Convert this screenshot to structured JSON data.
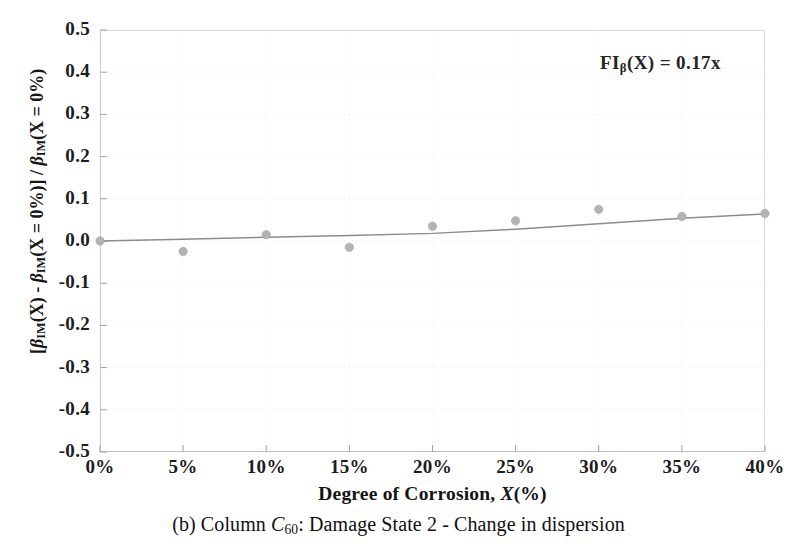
{
  "figure": {
    "caption_prefix": "(b) Column ",
    "caption_symbol": "C",
    "caption_symbol_sub": "60",
    "caption_suffix": ": Damage State 2 - Change in dispersion",
    "caption_full": "(b) Column C60: Damage State 2 - Change in dispersion"
  },
  "annotation": {
    "text_prefix": "FI",
    "text_sub": "β",
    "text_suffix": "(X) = 0.17x",
    "full": "FIβ(X) = 0.17x"
  },
  "axes": {
    "x_title_main": "Degree of Corrosion, ",
    "x_title_var": "X",
    "x_title_unit": "(%)",
    "x_title_full": "Degree of Corrosion, X(%)",
    "y_title_full": "[βIM(X) - βIM(X = 0%)] / βIM(X = 0%)",
    "y_title_parts": {
      "open": "[",
      "beta1": "β",
      "sub1": "IM",
      "mid1": "(X) - ",
      "beta2": "β",
      "sub2": "IM",
      "mid2": "(X = 0%)] / ",
      "beta3": "β",
      "sub3": "IM",
      "tail": "(X = 0%)"
    }
  },
  "chart_data": {
    "type": "scatter",
    "title": "",
    "subtitle": "",
    "xlabel": "Degree of Corrosion, X(%)",
    "ylabel": "[βIM(X) - βIM(X = 0%)] / βIM(X = 0%)",
    "x": [
      0,
      5,
      10,
      15,
      20,
      25,
      30,
      35,
      40
    ],
    "xtick_labels": [
      "0%",
      "5%",
      "10%",
      "15%",
      "20%",
      "25%",
      "30%",
      "35%",
      "40%"
    ],
    "ytick_labels": [
      "0.5",
      "0.4",
      "0.3",
      "0.2",
      "0.1",
      "0.0",
      "-0.1",
      "-0.2",
      "-0.3",
      "-0.4",
      "-0.5"
    ],
    "ytick_values": [
      0.5,
      0.4,
      0.3,
      0.2,
      0.1,
      0.0,
      -0.1,
      -0.2,
      -0.3,
      -0.4,
      -0.5
    ],
    "xlim": [
      0,
      40
    ],
    "ylim": [
      -0.5,
      0.5
    ],
    "grid": true,
    "legend": false,
    "series": [
      {
        "name": "data points",
        "marker": "circle",
        "color": "#b3b3b3",
        "values": [
          0.0,
          -0.025,
          0.015,
          -0.015,
          0.035,
          0.048,
          0.075,
          0.058,
          0.065
        ]
      },
      {
        "name": "trend line",
        "marker": "none",
        "color": "#8c8c8c",
        "values": [
          0.0,
          0.004,
          0.009,
          0.013,
          0.018,
          0.028,
          0.041,
          0.054,
          0.064
        ]
      }
    ],
    "annotation": "FIβ(X) = 0.17x"
  },
  "colors": {
    "marker": "#b3b3b3",
    "line": "#8c8c8c",
    "grid": "#ececec",
    "axis": "#b9b9b9",
    "text": "#161616"
  }
}
